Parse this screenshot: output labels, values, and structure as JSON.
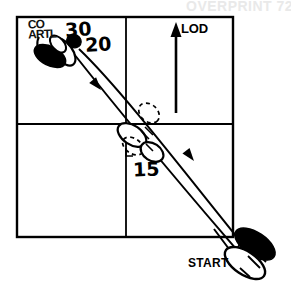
{
  "figure": {
    "kind": "dance-floor-step-diagram",
    "width": 291,
    "height": 299,
    "background_color": "#ffffff",
    "ink_color": "#000000",
    "ghost_color": "#e9e9e9"
  },
  "grid": {
    "name": "dance-floor-grid",
    "columns": 2,
    "rows": 2,
    "left": 17,
    "top": 17,
    "right": 233,
    "bottom": 237,
    "mid_x": 126,
    "mid_y": 124,
    "border_width": 2,
    "inner_width": 1.6
  },
  "labels": {
    "lod": "LOD",
    "start": "START",
    "step_30": "30",
    "step_20": "20",
    "step_15": "15",
    "obscured_overprint": "CO\nARTL"
  },
  "ghost_text": {
    "top": "OVERPRINT 72",
    "left": ""
  },
  "lod_arrow": {
    "name": "lod-direction-arrow",
    "x": 176,
    "y_tail": 112,
    "y_head": 26,
    "direction": "up",
    "stroke_width": 3
  },
  "paths": [
    {
      "name": "outbound-travel-path",
      "from": "START",
      "to": "step-30",
      "d": "M 236 248 C 200 208 130 130 72 55",
      "arrow_at": [
        {
          "x": 104,
          "y": 94,
          "angle": -128
        }
      ]
    },
    {
      "name": "inbound-travel-path",
      "from": "step-30",
      "to": "START",
      "d": "M 78 50 C 120 88 190 180 244 246",
      "arrow_at": [
        {
          "x": 196,
          "y": 164,
          "angle": -130
        }
      ]
    }
  ],
  "footprint_groups": [
    {
      "name": "footprints-step-30",
      "position": "top-left-quadrant",
      "feet": [
        {
          "name": "foot-filled-left",
          "fill": "solid",
          "cx": 52,
          "cy": 55,
          "rx": 16,
          "ry": 9,
          "angle": 28
        },
        {
          "name": "foot-outline-right",
          "fill": "outline",
          "cx": 63,
          "cy": 50,
          "rx": 15,
          "ry": 8,
          "angle": 58
        },
        {
          "name": "foot-small-toe",
          "fill": "solid",
          "cx": 73,
          "cy": 41,
          "rx": 7,
          "ry": 6,
          "angle": 30
        }
      ]
    },
    {
      "name": "footprints-step-15",
      "position": "center",
      "feet": [
        {
          "name": "foot-dashed-upper",
          "fill": "dashed",
          "cx": 148,
          "cy": 114,
          "rx": 11,
          "ry": 8,
          "angle": 40
        },
        {
          "name": "foot-outline-mid",
          "fill": "outline",
          "cx": 131,
          "cy": 136,
          "rx": 15,
          "ry": 9,
          "angle": 35
        },
        {
          "name": "foot-outline-lower",
          "fill": "outline",
          "cx": 152,
          "cy": 152,
          "rx": 12,
          "ry": 8,
          "angle": 35
        },
        {
          "name": "foot-dashed-lower",
          "fill": "dashed",
          "cx": 132,
          "cy": 145,
          "rx": 11,
          "ry": 7,
          "angle": 35
        }
      ]
    },
    {
      "name": "footprints-start",
      "position": "bottom-right",
      "feet": [
        {
          "name": "foot-filled-back",
          "fill": "solid",
          "cx": 254,
          "cy": 245,
          "rx": 22,
          "ry": 11,
          "angle": 36
        },
        {
          "name": "foot-outline-front",
          "fill": "outline",
          "cx": 244,
          "cy": 262,
          "rx": 22,
          "ry": 11,
          "angle": 36
        }
      ]
    }
  ]
}
